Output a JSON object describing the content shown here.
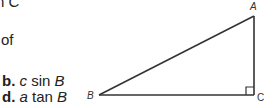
{
  "question": {
    "fragment_top": "n C",
    "fragment_of": "of"
  },
  "choices": [
    {
      "letter": "b.",
      "coef": "c",
      "func": "sin",
      "angle": "B"
    },
    {
      "letter": "d.",
      "coef": "a",
      "func": "tan",
      "angle": "B"
    }
  ],
  "diagram": {
    "type": "right-triangle",
    "right_angle_at": "C",
    "vertex_labels": {
      "A": "A",
      "B": "B",
      "C": "C"
    },
    "stroke_color": "#333333"
  }
}
